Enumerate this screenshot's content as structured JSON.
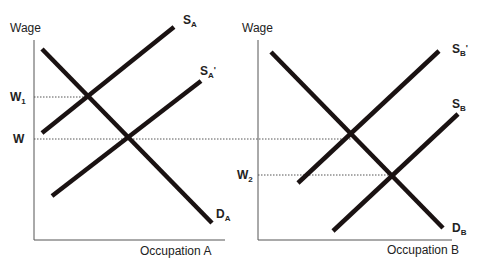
{
  "diagram": {
    "left_panel": {
      "y_axis_label": "Wage",
      "x_axis_label": "Occupation A",
      "curves": {
        "supply": {
          "main": "S",
          "sub": "A",
          "prime": ""
        },
        "supply_shifted": {
          "main": "S",
          "sub": "A",
          "prime": "'"
        },
        "demand": {
          "main": "D",
          "sub": "A",
          "prime": ""
        }
      },
      "wage_levels": {
        "w1": {
          "main": "W",
          "sub": "1"
        },
        "w": {
          "main": "W",
          "sub": ""
        }
      }
    },
    "right_panel": {
      "y_axis_label": "Wage",
      "x_axis_label": "Occupation B",
      "curves": {
        "supply_shifted": {
          "main": "S",
          "sub": "B",
          "prime": "'"
        },
        "supply": {
          "main": "S",
          "sub": "B",
          "prime": ""
        },
        "demand": {
          "main": "D",
          "sub": "B",
          "prime": ""
        }
      },
      "wage_levels": {
        "w2": {
          "main": "W",
          "sub": "2"
        }
      }
    },
    "colors": {
      "curve": "#1a1212",
      "axis": "#555555",
      "text": "#222222"
    }
  }
}
